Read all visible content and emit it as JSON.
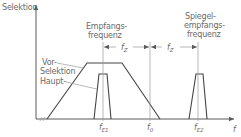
{
  "diagram": {
    "y_axis_label": "Selektion",
    "x_axis_label": "f",
    "annotations": {
      "empfang_line1": "Empfangs-",
      "empfang_line2": "frequenz",
      "spiegel_line1": "Spiegel-",
      "spiegel_line2": "empfangs-",
      "spiegel_line3": "frequenz",
      "vor_line1": "Vor-",
      "vor_line2": "Selektion",
      "haupt": "Haupt-"
    },
    "tick_labels": {
      "fE1_main": "f",
      "fE1_sub": "E1",
      "f0_main": "f",
      "f0_sub": "0",
      "fE2_main": "f",
      "fE2_sub": "E2"
    },
    "dimension_labels": {
      "fz1_main": "f",
      "fz1_sub": "Z",
      "fz2_main": "f",
      "fz2_sub": "Z"
    },
    "colors": {
      "line": "#5a5a5a",
      "text": "#6a6a6a",
      "background": "#ffffff"
    }
  }
}
